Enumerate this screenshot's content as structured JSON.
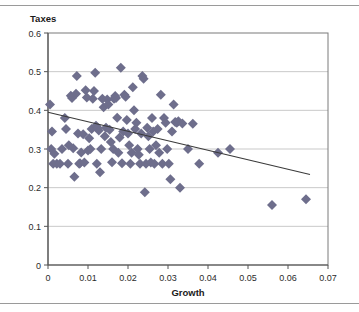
{
  "chart_data": {
    "type": "scatter",
    "title": "",
    "xlabel": "Growth",
    "ylabel": "Taxes",
    "xlim": [
      0,
      0.07
    ],
    "ylim": [
      0,
      0.6
    ],
    "xticks": [
      "0",
      "0.01",
      "0.02",
      "0.03",
      "0.04",
      "0.05",
      "0.06",
      "0.07"
    ],
    "xtick_values": [
      0,
      0.01,
      0.02,
      0.03,
      0.04,
      0.05,
      0.06,
      0.07
    ],
    "yticks": [
      "0",
      "0.1",
      "0.2",
      "0.3",
      "0.4",
      "0.5",
      "0.6"
    ],
    "ytick_values": [
      0,
      0.1,
      0.2,
      0.3,
      0.4,
      0.5,
      0.6
    ],
    "grid": "horizontal",
    "legend": "none",
    "marker": "diamond",
    "marker_color": "#6e6e8c",
    "marker_size": 5,
    "trendline": {
      "type": "linear",
      "color": "#3a3a3a",
      "x_start": 0.0,
      "y_start": 0.395,
      "x_end": 0.0655,
      "y_end": 0.234,
      "slope": -2.458,
      "intercept": 0.395
    },
    "series": [
      {
        "name": "Taxes vs Growth",
        "points": [
          [
            0.0005,
            0.415
          ],
          [
            0.0008,
            0.3
          ],
          [
            0.001,
            0.345
          ],
          [
            0.0013,
            0.262
          ],
          [
            0.0016,
            0.288
          ],
          [
            0.0022,
            0.262
          ],
          [
            0.003,
            0.262
          ],
          [
            0.0035,
            0.3
          ],
          [
            0.0042,
            0.38
          ],
          [
            0.0045,
            0.352
          ],
          [
            0.005,
            0.262
          ],
          [
            0.0052,
            0.31
          ],
          [
            0.0057,
            0.438
          ],
          [
            0.006,
            0.432
          ],
          [
            0.0063,
            0.302
          ],
          [
            0.0066,
            0.228
          ],
          [
            0.007,
            0.443
          ],
          [
            0.0072,
            0.489
          ],
          [
            0.0075,
            0.34
          ],
          [
            0.0078,
            0.262
          ],
          [
            0.008,
            0.263
          ],
          [
            0.0083,
            0.291
          ],
          [
            0.0088,
            0.338
          ],
          [
            0.0091,
            0.265
          ],
          [
            0.0094,
            0.452
          ],
          [
            0.0097,
            0.433
          ],
          [
            0.01,
            0.296
          ],
          [
            0.0103,
            0.328
          ],
          [
            0.0106,
            0.3
          ],
          [
            0.0109,
            0.352
          ],
          [
            0.0112,
            0.43
          ],
          [
            0.0115,
            0.45
          ],
          [
            0.0118,
            0.497
          ],
          [
            0.012,
            0.36
          ],
          [
            0.0122,
            0.262
          ],
          [
            0.0124,
            0.355
          ],
          [
            0.0127,
            0.348
          ],
          [
            0.013,
            0.24
          ],
          [
            0.0133,
            0.3
          ],
          [
            0.0136,
            0.43
          ],
          [
            0.0139,
            0.408
          ],
          [
            0.0142,
            0.333
          ],
          [
            0.0145,
            0.355
          ],
          [
            0.0148,
            0.428
          ],
          [
            0.0151,
            0.415
          ],
          [
            0.0154,
            0.35
          ],
          [
            0.0157,
            0.318
          ],
          [
            0.016,
            0.266
          ],
          [
            0.0163,
            0.3
          ],
          [
            0.0165,
            0.43
          ],
          [
            0.0168,
            0.437
          ],
          [
            0.017,
            0.432
          ],
          [
            0.0173,
            0.381
          ],
          [
            0.0176,
            0.29
          ],
          [
            0.0179,
            0.33
          ],
          [
            0.0182,
            0.51
          ],
          [
            0.0185,
            0.263
          ],
          [
            0.0188,
            0.345
          ],
          [
            0.0191,
            0.44
          ],
          [
            0.0194,
            0.435
          ],
          [
            0.0197,
            0.375
          ],
          [
            0.02,
            0.34
          ],
          [
            0.0203,
            0.31
          ],
          [
            0.0206,
            0.262
          ],
          [
            0.0209,
            0.29
          ],
          [
            0.0212,
            0.46
          ],
          [
            0.0215,
            0.4
          ],
          [
            0.0218,
            0.352
          ],
          [
            0.0221,
            0.368
          ],
          [
            0.0224,
            0.3
          ],
          [
            0.0227,
            0.285
          ],
          [
            0.023,
            0.262
          ],
          [
            0.0233,
            0.34
          ],
          [
            0.0236,
            0.489
          ],
          [
            0.0239,
            0.482
          ],
          [
            0.0242,
            0.188
          ],
          [
            0.0245,
            0.262
          ],
          [
            0.0248,
            0.355
          ],
          [
            0.0251,
            0.333
          ],
          [
            0.0254,
            0.3
          ],
          [
            0.0257,
            0.265
          ],
          [
            0.026,
            0.38
          ],
          [
            0.0263,
            0.345
          ],
          [
            0.0266,
            0.262
          ],
          [
            0.027,
            0.31
          ],
          [
            0.0274,
            0.352
          ],
          [
            0.0278,
            0.29
          ],
          [
            0.0282,
            0.44
          ],
          [
            0.0286,
            0.262
          ],
          [
            0.029,
            0.38
          ],
          [
            0.0294,
            0.368
          ],
          [
            0.0298,
            0.3
          ],
          [
            0.0302,
            0.262
          ],
          [
            0.0306,
            0.222
          ],
          [
            0.031,
            0.345
          ],
          [
            0.0314,
            0.415
          ],
          [
            0.0318,
            0.37
          ],
          [
            0.0322,
            0.368
          ],
          [
            0.0326,
            0.372
          ],
          [
            0.033,
            0.2
          ],
          [
            0.0336,
            0.366
          ],
          [
            0.035,
            0.3
          ],
          [
            0.0362,
            0.365
          ],
          [
            0.0378,
            0.262
          ],
          [
            0.0425,
            0.29
          ],
          [
            0.0455,
            0.3
          ],
          [
            0.056,
            0.155
          ],
          [
            0.0645,
            0.17
          ]
        ]
      }
    ]
  }
}
